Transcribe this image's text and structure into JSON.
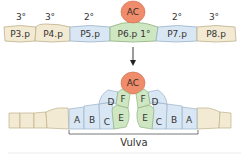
{
  "colors": {
    "tertiary_fill": "#f3ead3",
    "tertiary_stroke": "#bfb08a",
    "secondary_fill": "#d9e7f4",
    "secondary_stroke": "#9ab2c8",
    "primary_fill": "#cfe6c2",
    "primary_stroke": "#8fb37d",
    "anchor_fill": "#ee8c6c",
    "anchor_stroke": "#d06a4a"
  },
  "top_row": {
    "anchor_cell": "AC",
    "cells": [
      {
        "name": "P3.p",
        "fate": "3°",
        "type": "tertiary"
      },
      {
        "name": "P4.p",
        "fate": "3°",
        "type": "tertiary"
      },
      {
        "name": "P5.p",
        "fate": "2°",
        "type": "secondary"
      },
      {
        "name": "P6.p 1°",
        "fate": "",
        "type": "primary"
      },
      {
        "name": "P7.p",
        "fate": "2°",
        "type": "secondary"
      },
      {
        "name": "P8.p",
        "fate": "3°",
        "type": "tertiary"
      }
    ]
  },
  "bottom_row": {
    "anchor_cell": "AC",
    "left_cells": [
      "A",
      "B",
      "C",
      "E",
      "D",
      "F"
    ],
    "right_cells": [
      "F",
      "D",
      "E",
      "C",
      "B",
      "A"
    ],
    "bracket_label": "Vulva"
  }
}
